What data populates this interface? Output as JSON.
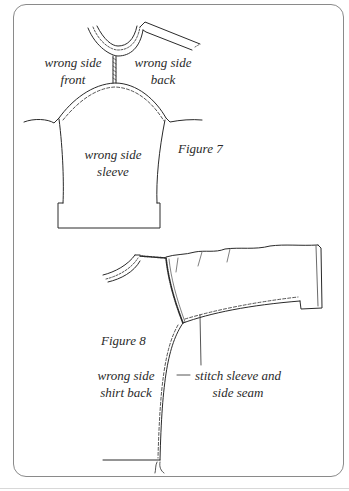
{
  "figure7": {
    "caption": "Figure 7",
    "labels": {
      "front": {
        "line1": "wrong side",
        "line2": "front"
      },
      "back": {
        "line1": "wrong side",
        "line2": "back"
      },
      "sleeve": {
        "line1": "wrong side",
        "line2": "sleeve"
      }
    }
  },
  "figure8": {
    "caption": "Figure 8",
    "labels": {
      "shirt_back": {
        "line1": "wrong side",
        "line2": "shirt back"
      },
      "instruction": {
        "line1": "stitch sleeve and",
        "line2": "side seam"
      }
    }
  },
  "colors": {
    "line": "#2a2a2a",
    "frame": "#8a8a8a",
    "background": "#ffffff"
  }
}
